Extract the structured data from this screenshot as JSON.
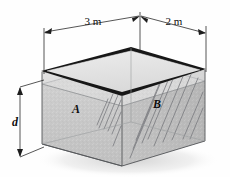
{
  "figure": {
    "dimensions": {
      "length_label": "3 m",
      "width_label": "2 m",
      "depth_label": "d"
    },
    "regions": {
      "front_label": "A",
      "side_label": "B"
    },
    "colors": {
      "rim_dark": "#1a1a1a",
      "front_face": "#c9c9c9",
      "side_face": "#bdbdbd",
      "floor_face": "#b4b4b4",
      "surface_band": "#dcdcdc",
      "top_opening": "#e4e4e4",
      "outline": "#55575a",
      "dimension_line": "#2b2b2b",
      "shadow": "#d8d8d8",
      "hatch": "#7c7e82",
      "background": "#fefefe"
    },
    "geometry": {
      "front_top_left": [
        42,
        72
      ],
      "front_top_right": [
        122,
        95
      ],
      "right_top_right": [
        205,
        70
      ],
      "back_top": [
        140,
        50
      ],
      "front_bottom_left": [
        42,
        144
      ],
      "front_bottom_right": [
        122,
        166
      ],
      "right_bottom_right": [
        205,
        141
      ],
      "water_line_y": 86
    }
  }
}
